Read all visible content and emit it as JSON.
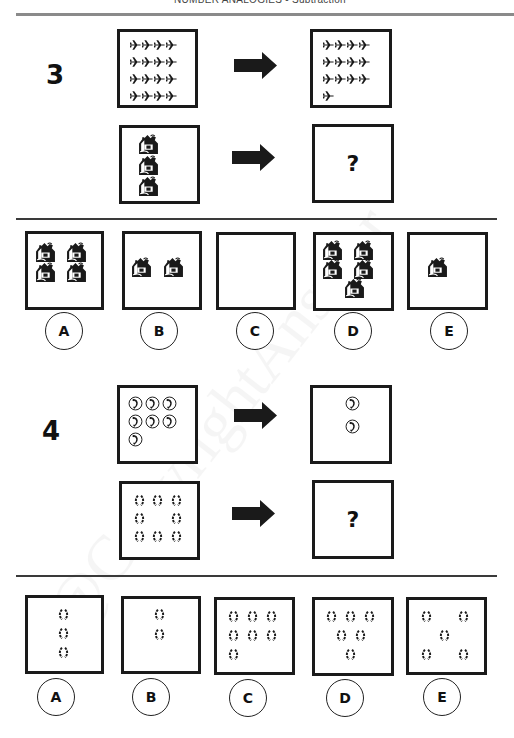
{
  "header": {
    "title": "NUMBER ANALOGIES - Subtraction"
  },
  "watermark": "@CopyrightAnswer",
  "colors": {
    "ink": "#1a1a1a",
    "rule": "#8a8a8a",
    "background": "#ffffff"
  },
  "questions": [
    {
      "number": "3",
      "icon": "airplane-icon / house-icon",
      "example": {
        "left_count": 16,
        "left_icon": "airplane-icon",
        "right_count": 13,
        "right_icon": "airplane-icon"
      },
      "problem": {
        "left_count": 3,
        "left_icon": "house-icon",
        "unknown": "?"
      },
      "options": [
        {
          "label": "A",
          "count": 4,
          "icon": "house-icon"
        },
        {
          "label": "B",
          "count": 2,
          "icon": "house-icon"
        },
        {
          "label": "C",
          "count": 0,
          "icon": "house-icon"
        },
        {
          "label": "D",
          "count": 5,
          "icon": "house-icon"
        },
        {
          "label": "E",
          "count": 1,
          "icon": "house-icon"
        }
      ]
    },
    {
      "number": "4",
      "icon": "telephone-icon / broken-circle-icon",
      "example": {
        "left_count": 7,
        "left_icon": "telephone-icon",
        "right_count": 2,
        "right_icon": "telephone-icon"
      },
      "problem": {
        "left_count": 8,
        "left_icon": "broken-circle-icon",
        "unknown": "?"
      },
      "options": [
        {
          "label": "A",
          "count": 3,
          "icon": "broken-circle-icon"
        },
        {
          "label": "B",
          "count": 2,
          "icon": "broken-circle-icon"
        },
        {
          "label": "C",
          "count": 7,
          "icon": "broken-circle-icon"
        },
        {
          "label": "D",
          "count": 6,
          "icon": "broken-circle-icon"
        },
        {
          "label": "E",
          "count": 5,
          "icon": "broken-circle-icon"
        }
      ]
    }
  ]
}
